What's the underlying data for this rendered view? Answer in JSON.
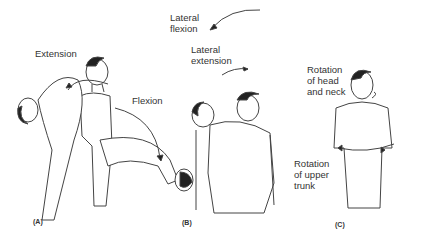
{
  "figure": {
    "panels": [
      {
        "id": "A",
        "label": "(A)",
        "annotations": [
          "Extension",
          "Flexion"
        ]
      },
      {
        "id": "B",
        "label": "(B)",
        "annotations": [
          "Lateral\nflexion",
          "Lateral\nextension"
        ]
      },
      {
        "id": "C",
        "label": "(C)",
        "annotations": [
          "Rotation\nof head\nand neck",
          "Rotation\nof upper\ntrunk"
        ]
      }
    ]
  }
}
